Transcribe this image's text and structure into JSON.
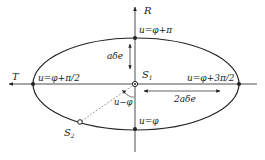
{
  "diagram": {
    "axes": {
      "vertical_label": "R",
      "horizontal_label": "T"
    },
    "points": {
      "s1": {
        "label": "S",
        "sub": "1"
      },
      "s2": {
        "label": "S",
        "sub": "2"
      }
    },
    "ellipse_labels": {
      "top": "u=φ+π",
      "left": "u=φ+π/2",
      "right": "u=φ+3π/2",
      "bottom": "u=φ"
    },
    "dimensions": {
      "semi_minor": "aδe",
      "major": "2aδe"
    },
    "angle_label": "u−φ",
    "colors": {
      "line": "#222222",
      "dashed": "#555555",
      "background": "#ffffff"
    }
  }
}
